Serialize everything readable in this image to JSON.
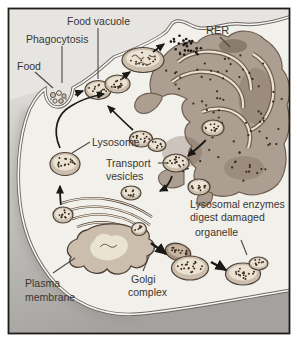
{
  "labels": {
    "food_vacuole": "Food vacuole",
    "phagocytosis": "Phagocytosis",
    "food": "Food",
    "rer": "RER",
    "lysosome": "Lysosome",
    "transport_vesicles": [
      "Transport",
      "vesicles"
    ],
    "lysosomal_note": [
      "Lysosomal enzymes",
      "digest damaged",
      "organelle"
    ],
    "golgi_complex": [
      "Golgi",
      "complex"
    ],
    "plasma_membrane": [
      "Plasma",
      "membrane"
    ]
  },
  "colors": {
    "frame_border": "#1f1d1b",
    "outside_bg": "#e7e5e1",
    "cell_fill": "#f2f0eb",
    "shadow_light": "#dddcd8",
    "shadow_dark": "#a3a29f",
    "membrane_dark": "#6b6762",
    "membrane_light": "#faf8f4",
    "organelle_fill": "#cbbead",
    "organelle_light": "#eae2d3",
    "organelle_outline": "#4e4136",
    "organelle_dark": "#a5937f",
    "rer_fill": "#ac9e90",
    "rer_dark": "#6f5e50",
    "ribosome_dot": "#38291c",
    "arrow": "#1b1916",
    "text": "#3a3631",
    "pointer_line": "#4b4742"
  }
}
